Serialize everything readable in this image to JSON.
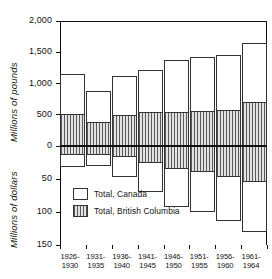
{
  "chart_data": {
    "type": "bar",
    "title": "",
    "subtitle": "",
    "orientation": "vertical-bidirectional",
    "categories": [
      "1926-1930",
      "1931-1935",
      "1936-1940",
      "1941-1945",
      "1946-1950",
      "1951-1955",
      "1956-1960",
      "1961-1964"
    ],
    "category_lines": [
      [
        "1926-",
        "1930"
      ],
      [
        "1931-",
        "1935"
      ],
      [
        "1936-",
        "1940"
      ],
      [
        "1941-",
        "1945"
      ],
      [
        "1946-",
        "1950"
      ],
      [
        "1951-",
        "1955"
      ],
      [
        "1956-",
        "1960"
      ],
      [
        "1961-",
        "1964"
      ]
    ],
    "upper_axis": {
      "label": "Millions of pounds",
      "ticks": [
        "0",
        "500",
        "1,000",
        "1,500",
        "2,000"
      ],
      "tick_values": [
        0,
        500,
        1000,
        1500,
        2000
      ],
      "range": [
        0,
        2000
      ],
      "direction": "up"
    },
    "lower_axis": {
      "label": "Millions of dollars",
      "ticks": [
        "0",
        "50",
        "100",
        "150"
      ],
      "tick_values": [
        0,
        50,
        100,
        150
      ],
      "range": [
        0,
        150
      ],
      "direction": "down"
    },
    "legend": {
      "position": "inside-lower-left",
      "entries": [
        {
          "label": "Total, Canada",
          "swatch": "white"
        },
        {
          "label": "Total, British Columbia",
          "swatch": "vertical-hatch"
        }
      ]
    },
    "series": [
      {
        "name": "Total, Canada",
        "panel": "upper",
        "unit": "millions of pounds",
        "values": [
          1150,
          880,
          1120,
          1220,
          1380,
          1430,
          1450,
          1650
        ]
      },
      {
        "name": "Total, British Columbia",
        "panel": "upper",
        "unit": "millions of pounds",
        "values": [
          510,
          380,
          500,
          540,
          550,
          560,
          580,
          700
        ]
      },
      {
        "name": "Total, Canada",
        "panel": "lower",
        "unit": "millions of dollars",
        "values": [
          32,
          30,
          47,
          70,
          92,
          100,
          113,
          130
        ]
      },
      {
        "name": "Total, British Columbia",
        "panel": "lower",
        "unit": "millions of dollars",
        "values": [
          14,
          14,
          17,
          25,
          35,
          40,
          47,
          55
        ]
      }
    ],
    "grid": false,
    "frame": "top-and-right-box"
  },
  "axes": {
    "pounds_title": "Millions of pounds",
    "dollars_title": "Millions of dollars"
  },
  "legend": {
    "canada": "Total, Canada",
    "bc": "Total, British Columbia"
  }
}
